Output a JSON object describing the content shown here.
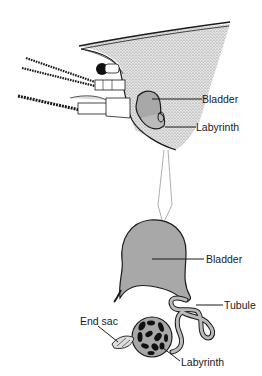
{
  "diagram": {
    "top_view": {
      "description": "Crustacean head with antennal gland",
      "labels": {
        "bladder": "Bladder",
        "labyrinth": "Labyrinth"
      }
    },
    "bottom_view": {
      "description": "Enlarged antennal gland",
      "labels": {
        "bladder": "Bladder",
        "tubule": "Tubule",
        "end_sac": "End sac",
        "labyrinth": "Labyrinth"
      }
    },
    "colors": {
      "organ_fill": "#a8a8a8",
      "body_stipple": "#c8c8c8",
      "outline": "#1a1a1a",
      "connector": "#999999"
    }
  }
}
